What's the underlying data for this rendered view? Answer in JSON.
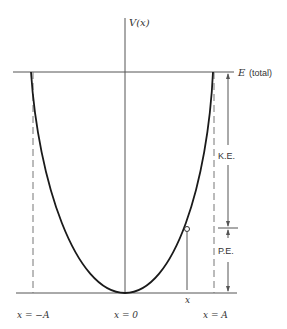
{
  "diagram": {
    "labels": {
      "y_axis": "V(x)",
      "energy_line": "E",
      "energy_suffix": "(total)",
      "kinetic": "K.E.",
      "potential": "P.E.",
      "x_marker": "x",
      "left_turning_point": "x = −A",
      "center": "x = 0",
      "right_turning_point": "x = A"
    },
    "colors": {
      "curve": "#1a1a1a",
      "lines": "#555555",
      "text": "#333333"
    }
  }
}
